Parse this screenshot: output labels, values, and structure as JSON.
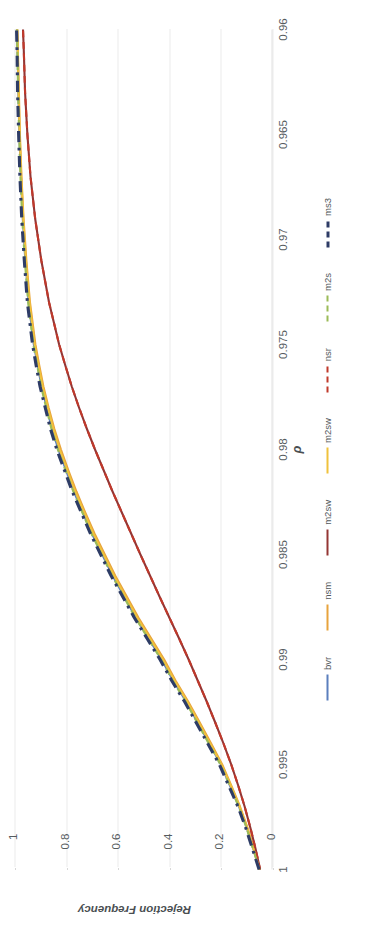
{
  "chart_data": {
    "type": "line",
    "title": "",
    "xlabel": "ρ",
    "ylabel": "Rejection Frequency",
    "xticks": [
      "1",
      "0.995",
      "0.99",
      "0.985",
      "0.98",
      "0.975",
      "0.97",
      "0.965",
      "0.96"
    ],
    "xtick_values": [
      1,
      0.995,
      0.99,
      0.985,
      0.98,
      0.975,
      0.97,
      0.965,
      0.96
    ],
    "yticks": [
      "0",
      "0.2",
      "0.4",
      "0.6",
      "0.8",
      "1"
    ],
    "ytick_values": [
      0,
      0.2,
      0.4,
      0.6,
      0.8,
      1
    ],
    "xlim": [
      1,
      0.96
    ],
    "ylim": [
      0,
      1
    ],
    "x_axis_reversed": true,
    "grid": "horizontal-dotted",
    "legend_position": "bottom",
    "x": [
      1,
      0.999,
      0.998,
      0.997,
      0.996,
      0.995,
      0.994,
      0.993,
      0.992,
      0.991,
      0.99,
      0.989,
      0.988,
      0.987,
      0.986,
      0.985,
      0.984,
      0.983,
      0.982,
      0.981,
      0.98,
      0.979,
      0.978,
      0.977,
      0.976,
      0.975,
      0.973,
      0.971,
      0.969,
      0.967,
      0.965,
      0.963,
      0.961,
      0.96
    ],
    "series": [
      {
        "name": "bvr",
        "color": "#5b7fbd",
        "dash": "solid",
        "values": [
          0.05,
          0.075,
          0.1,
          0.13,
          0.165,
          0.2,
          0.245,
          0.29,
          0.335,
          0.385,
          0.43,
          0.48,
          0.53,
          0.575,
          0.62,
          0.66,
          0.7,
          0.735,
          0.77,
          0.8,
          0.83,
          0.855,
          0.875,
          0.895,
          0.91,
          0.925,
          0.945,
          0.958,
          0.968,
          0.975,
          0.981,
          0.985,
          0.988,
          0.99
        ]
      },
      {
        "name": "nsm",
        "color": "#e8a33d",
        "dash": "solid",
        "values": [
          0.05,
          0.072,
          0.097,
          0.126,
          0.16,
          0.195,
          0.238,
          0.282,
          0.327,
          0.376,
          0.42,
          0.47,
          0.52,
          0.565,
          0.61,
          0.65,
          0.69,
          0.726,
          0.76,
          0.791,
          0.82,
          0.846,
          0.868,
          0.888,
          0.904,
          0.919,
          0.94,
          0.954,
          0.965,
          0.973,
          0.979,
          0.983,
          0.987,
          0.989
        ]
      },
      {
        "name": "m2sw",
        "color": "#943634",
        "dash": "solid",
        "values": [
          0.048,
          0.066,
          0.086,
          0.108,
          0.133,
          0.16,
          0.19,
          0.222,
          0.255,
          0.29,
          0.325,
          0.362,
          0.4,
          0.438,
          0.475,
          0.512,
          0.548,
          0.584,
          0.62,
          0.654,
          0.688,
          0.72,
          0.75,
          0.778,
          0.803,
          0.827,
          0.866,
          0.896,
          0.92,
          0.938,
          0.95,
          0.959,
          0.964,
          0.967
        ]
      },
      {
        "name": "m2sw",
        "color": "#f0c23c",
        "dash": "solid",
        "values": [
          0.05,
          0.074,
          0.099,
          0.128,
          0.162,
          0.198,
          0.242,
          0.286,
          0.331,
          0.38,
          0.425,
          0.475,
          0.525,
          0.57,
          0.615,
          0.655,
          0.695,
          0.73,
          0.765,
          0.795,
          0.825,
          0.85,
          0.871,
          0.891,
          0.907,
          0.922,
          0.942,
          0.956,
          0.966,
          0.974,
          0.98,
          0.984,
          0.987,
          0.989
        ]
      },
      {
        "name": "nsr",
        "color": "#c0392b",
        "dash": "dashed",
        "values": [
          0.048,
          0.066,
          0.086,
          0.108,
          0.133,
          0.16,
          0.19,
          0.222,
          0.255,
          0.29,
          0.325,
          0.362,
          0.4,
          0.438,
          0.475,
          0.512,
          0.548,
          0.584,
          0.62,
          0.654,
          0.688,
          0.72,
          0.75,
          0.778,
          0.803,
          0.827,
          0.866,
          0.896,
          0.92,
          0.938,
          0.95,
          0.959,
          0.964,
          0.967
        ]
      },
      {
        "name": "m2s",
        "color": "#9bbb59",
        "dash": "dashed",
        "values": [
          0.05,
          0.076,
          0.101,
          0.131,
          0.166,
          0.202,
          0.247,
          0.292,
          0.337,
          0.387,
          0.432,
          0.482,
          0.532,
          0.577,
          0.622,
          0.662,
          0.702,
          0.737,
          0.772,
          0.802,
          0.832,
          0.857,
          0.877,
          0.897,
          0.912,
          0.927,
          0.947,
          0.96,
          0.97,
          0.977,
          0.982,
          0.986,
          0.989,
          0.991
        ]
      },
      {
        "name": "ms3",
        "color": "#2e3c66",
        "dash": "dashdot",
        "values": [
          0.052,
          0.078,
          0.104,
          0.134,
          0.17,
          0.206,
          0.251,
          0.296,
          0.341,
          0.391,
          0.436,
          0.486,
          0.536,
          0.581,
          0.626,
          0.666,
          0.706,
          0.741,
          0.776,
          0.806,
          0.836,
          0.861,
          0.881,
          0.901,
          0.916,
          0.93,
          0.95,
          0.962,
          0.972,
          0.979,
          0.984,
          0.988,
          0.99,
          0.992
        ]
      }
    ]
  }
}
